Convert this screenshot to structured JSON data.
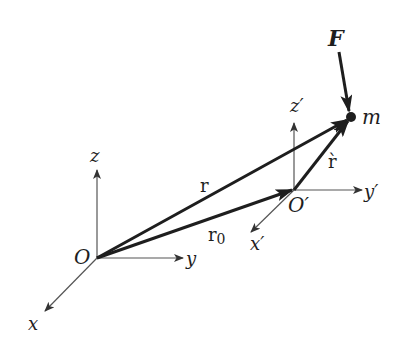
{
  "figure": {
    "colors": {
      "background": "#ffffff",
      "ink": "#1e1e1e",
      "axis": "#555555"
    }
  },
  "frame_fixed": {
    "origin_label": "O",
    "x_label": "x",
    "y_label": "y",
    "z_label": "z"
  },
  "frame_moving": {
    "origin_label": "O′",
    "x_label": "x′",
    "y_label": "y′",
    "z_label": "z′"
  },
  "vectors": {
    "r_label": "r",
    "r0_label": "r",
    "r0_subscript": "0",
    "r_prime_label": "r̀"
  },
  "particle": {
    "mass_label": "m",
    "force_label": "F"
  }
}
